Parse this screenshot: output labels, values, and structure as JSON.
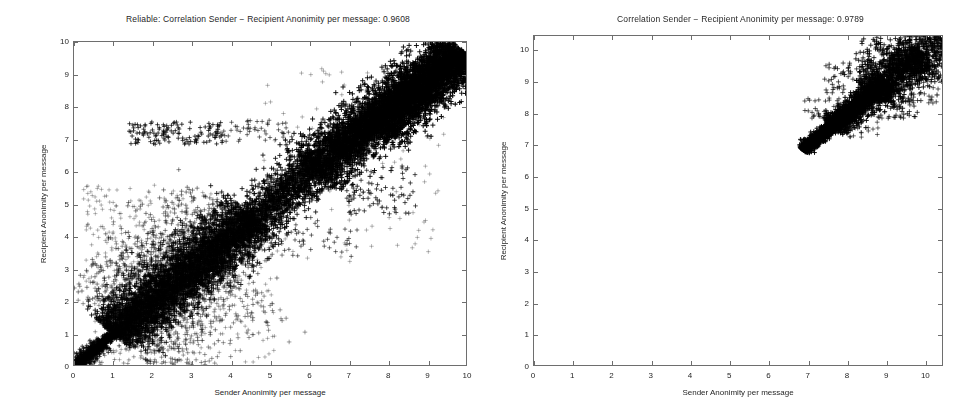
{
  "figure": {
    "background_color": "#ffffff",
    "marker_color": "#000000",
    "axis_color": "#6e6e6e",
    "marker_symbol": "+"
  },
  "panels": [
    {
      "id": "left",
      "title": "Reliable: Correlation Sender − Recipient Anonimity per message: 0.9608",
      "xlabel": "Sender Anonimity per message",
      "ylabel": "Recipient Anonimity per message",
      "xticks": [
        "0",
        "1",
        "2",
        "3",
        "4",
        "5",
        "6",
        "7",
        "8",
        "9",
        "10"
      ],
      "yticks": [
        "0",
        "1",
        "2",
        "3",
        "4",
        "5",
        "6",
        "7",
        "8",
        "9",
        "10"
      ],
      "correlation": "0.9608"
    },
    {
      "id": "right",
      "title": "Correlation Sender − Recipient Anonimity per message: 0.9789",
      "xlabel": "Sender Anonimity per message",
      "ylabel": "Recipient Anonimity per message",
      "xticks": [
        "0",
        "1",
        "2",
        "3",
        "4",
        "5",
        "6",
        "7",
        "8",
        "9",
        "10"
      ],
      "yticks": [
        "0",
        "1",
        "2",
        "3",
        "4",
        "5",
        "6",
        "7",
        "8",
        "9",
        "10"
      ],
      "correlation": "0.9789"
    }
  ],
  "chart_data": [
    {
      "type": "scatter",
      "panel": "left",
      "title": "Reliable: Correlation Sender − Recipient Anonimity per message: 0.9608",
      "xlabel": "Sender Anonimity per message",
      "ylabel": "Recipient Anonimity per message",
      "xlim": [
        0,
        10
      ],
      "ylim": [
        0,
        10
      ],
      "xticks": [
        0,
        1,
        2,
        3,
        4,
        5,
        6,
        7,
        8,
        9,
        10
      ],
      "yticks": [
        0,
        1,
        2,
        3,
        4,
        5,
        6,
        7,
        8,
        9,
        10
      ],
      "grid": false,
      "legend": false,
      "marker": "+",
      "color": "#000000",
      "correlation": 0.9608,
      "n_points_approx": 9000,
      "description": "Dense elongated point cloud along the y = x diagonal spanning the full range 0 to 10; heaviest saturation between 2 and 4 and again between 6 and 9.5; a thin tight streak hugs the diagonal near the origin below 1; scattered outliers above the diagonal around x 1.5-3, y 7-7.5 and below the diagonal around x 7-8.5, y 5-6.",
      "clusters": [
        {
          "name": "near-origin-streak",
          "x_range": [
            0.0,
            1.2
          ],
          "y_range": [
            0.0,
            1.2
          ],
          "density": "tight-line"
        },
        {
          "name": "low-mid-core",
          "x_range": [
            1.0,
            4.5
          ],
          "y_range": [
            1.0,
            4.5
          ],
          "density": "very-high"
        },
        {
          "name": "mid-band",
          "x_range": [
            4.0,
            6.5
          ],
          "y_range": [
            4.0,
            6.5
          ],
          "density": "high"
        },
        {
          "name": "upper-core",
          "x_range": [
            6.0,
            9.8
          ],
          "y_range": [
            6.0,
            9.8
          ],
          "density": "saturated"
        },
        {
          "name": "upper-left-outliers",
          "x_range": [
            1.5,
            3.5
          ],
          "y_range": [
            6.8,
            7.6
          ],
          "density": "sparse"
        },
        {
          "name": "lower-right-outliers",
          "x_range": [
            6.8,
            8.8
          ],
          "y_range": [
            4.8,
            6.2
          ],
          "density": "sparse"
        }
      ],
      "series": [
        {
          "name": "message pairs",
          "x": [
            0.05,
            0.12,
            0.2,
            0.28,
            0.35,
            0.45,
            0.55,
            0.62,
            0.7,
            0.8,
            0.9,
            1.0,
            1.1,
            1.25,
            1.4,
            1.55,
            1.7,
            1.85,
            2.0,
            2.15,
            2.3,
            2.45,
            2.6,
            2.75,
            2.9,
            3.05,
            3.2,
            3.35,
            3.5,
            3.65,
            3.8,
            3.95,
            4.1,
            4.3,
            4.5,
            4.7,
            4.9,
            5.1,
            5.3,
            5.5,
            5.7,
            5.9,
            6.1,
            6.3,
            6.5,
            6.7,
            6.9,
            7.1,
            7.3,
            7.5,
            7.7,
            7.9,
            8.1,
            8.3,
            8.5,
            8.7,
            8.9,
            9.1,
            9.3,
            9.5
          ],
          "y": [
            0.06,
            0.14,
            0.22,
            0.3,
            0.38,
            0.48,
            0.58,
            0.64,
            0.74,
            0.86,
            0.95,
            1.08,
            1.2,
            1.35,
            1.5,
            1.62,
            1.8,
            1.95,
            2.1,
            2.25,
            2.42,
            2.55,
            2.7,
            2.85,
            3.0,
            3.15,
            3.3,
            3.45,
            3.62,
            3.75,
            3.9,
            4.05,
            4.2,
            4.4,
            4.6,
            4.8,
            5.0,
            5.2,
            5.4,
            5.6,
            5.8,
            6.0,
            6.2,
            6.4,
            6.6,
            6.8,
            7.0,
            7.2,
            7.4,
            7.6,
            7.8,
            8.0,
            8.2,
            8.4,
            8.6,
            8.8,
            9.0,
            9.2,
            9.4,
            9.6
          ]
        }
      ]
    },
    {
      "type": "scatter",
      "panel": "right",
      "title": "Correlation Sender − Recipient Anonimity per message: 0.9789",
      "xlabel": "Sender Anonimity per message",
      "ylabel": "Recipient Anonimity per message",
      "xlim": [
        0,
        10.45
      ],
      "ylim": [
        0,
        10.45
      ],
      "xticks": [
        0,
        1,
        2,
        3,
        4,
        5,
        6,
        7,
        8,
        9,
        10
      ],
      "yticks": [
        0,
        1,
        2,
        3,
        4,
        5,
        6,
        7,
        8,
        9,
        10
      ],
      "grid": false,
      "legend": false,
      "marker": "+",
      "color": "#000000",
      "correlation": 0.9789,
      "n_points_approx": 3000,
      "description": "Single compact elongated cluster confined to the upper-right corner along the y = x diagonal; points run from a dense narrow tip near (6.9, 6.9) widening toward (10.3, 10.3); the rest of the axes is empty.",
      "clusters": [
        {
          "name": "diagonal-tip",
          "x_range": [
            6.8,
            7.6
          ],
          "y_range": [
            6.8,
            7.6
          ],
          "density": "saturated"
        },
        {
          "name": "diagonal-body",
          "x_range": [
            7.6,
            9.2
          ],
          "y_range": [
            7.6,
            9.2
          ],
          "density": "very-high"
        },
        {
          "name": "diagonal-spread",
          "x_range": [
            9.2,
            10.4
          ],
          "y_range": [
            8.8,
            10.4
          ],
          "density": "medium"
        },
        {
          "name": "below-diagonal-outliers",
          "x_range": [
            8.6,
            9.8
          ],
          "y_range": [
            7.8,
            8.4
          ],
          "density": "sparse"
        }
      ],
      "series": [
        {
          "name": "message pairs",
          "x": [
            6.85,
            6.95,
            7.05,
            7.15,
            7.25,
            7.35,
            7.45,
            7.55,
            7.65,
            7.75,
            7.85,
            7.95,
            8.05,
            8.15,
            8.25,
            8.35,
            8.45,
            8.55,
            8.65,
            8.75,
            8.85,
            8.95,
            9.05,
            9.15,
            9.25,
            9.35,
            9.45,
            9.55,
            9.65,
            9.75,
            9.85,
            9.95,
            10.05,
            10.15,
            10.25,
            10.35
          ],
          "y": [
            6.88,
            6.98,
            7.08,
            7.18,
            7.3,
            7.4,
            7.5,
            7.6,
            7.7,
            7.82,
            7.92,
            8.02,
            8.12,
            8.24,
            8.34,
            8.44,
            8.54,
            8.66,
            8.76,
            8.86,
            8.96,
            9.06,
            9.16,
            9.26,
            9.36,
            9.46,
            9.56,
            9.66,
            9.76,
            9.86,
            9.96,
            10.06,
            10.14,
            10.22,
            10.3,
            10.38
          ]
        }
      ]
    }
  ]
}
